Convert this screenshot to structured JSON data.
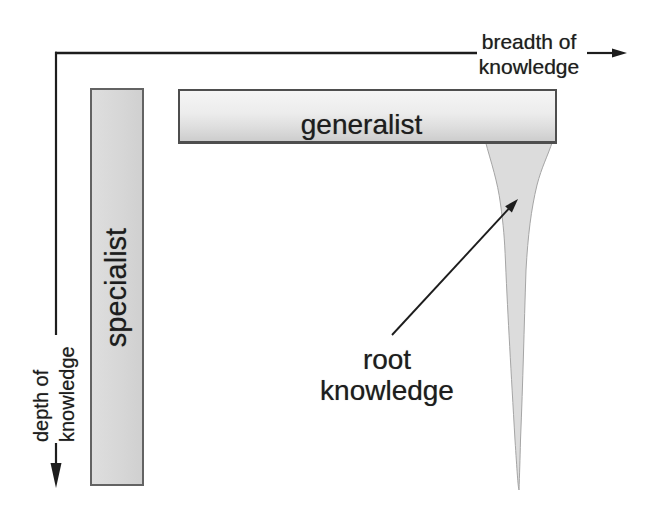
{
  "diagram": {
    "title_semantic": "breadth vs depth of knowledge diagram",
    "background_color": "#ffffff",
    "ink_color": "#1d1d1d",
    "axes": {
      "breadth": {
        "line1": "breadth of",
        "line2": "knowledge"
      },
      "depth": {
        "line1": "depth of",
        "line2": "knowledge"
      }
    },
    "bars": {
      "specialist": {
        "label": "specialist",
        "fill": "#d8d8d8",
        "border": "#636363"
      },
      "generalist": {
        "label": "generalist",
        "fill_top": "#f5f5f5",
        "fill_bottom": "#cdcdcd",
        "border": "#4e4e4e"
      }
    },
    "annotation": {
      "line1": "root",
      "line2": "knowledge"
    },
    "root_spike": {
      "fill": "#dcdcdc",
      "stroke": "#a5a5a5"
    }
  }
}
